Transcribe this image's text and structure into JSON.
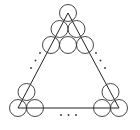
{
  "diagram": {
    "type": "circles-in-triangle",
    "stroke_color": "#333333",
    "background": "#ffffff",
    "triangle": {
      "vertices": [
        [
          68,
          13
        ],
        [
          18,
          108
        ],
        [
          119,
          108
        ]
      ]
    },
    "circle_radius": 8.5,
    "circles": {
      "apex_cluster": [
        [
          68,
          13
        ],
        [
          59.5,
          29
        ],
        [
          76.5,
          29
        ],
        [
          51,
          45
        ],
        [
          68,
          45
        ],
        [
          85,
          45
        ]
      ],
      "bottom_left_cluster": [
        [
          26.5,
          92
        ],
        [
          18,
          108
        ],
        [
          35,
          108
        ]
      ],
      "bottom_right_cluster": [
        [
          110.5,
          92
        ],
        [
          102,
          108
        ],
        [
          119,
          108
        ]
      ]
    },
    "ellipsis_dots": {
      "left_edge": [
        [
          40,
          53
        ],
        [
          35.5,
          60.5
        ],
        [
          31,
          68
        ]
      ],
      "right_edge": [
        [
          96,
          53
        ],
        [
          100.5,
          60.5
        ],
        [
          105,
          68
        ]
      ],
      "bottom_edge": [
        [
          61,
          115
        ],
        [
          68.5,
          115
        ],
        [
          76,
          115
        ]
      ]
    },
    "dot_radius": 0.9
  }
}
